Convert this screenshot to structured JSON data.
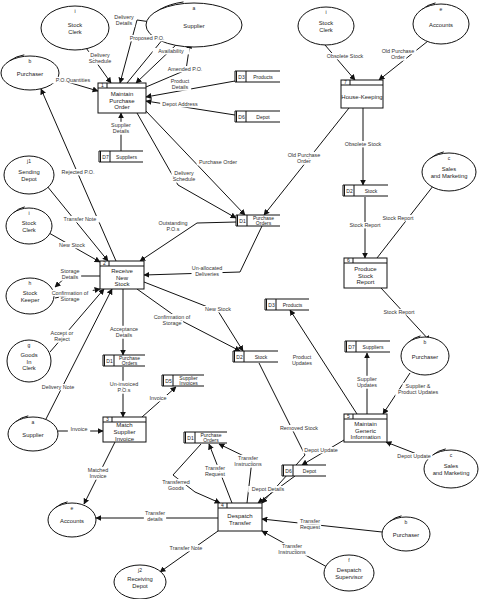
{
  "diagram": {
    "type": "data-flow-diagram",
    "external_entities": [
      {
        "id": "stock-clerk-1",
        "letter": "i",
        "lines": [
          "Stock",
          "Clerk"
        ],
        "cx": 75,
        "cy": 28,
        "rx": 34,
        "ry": 22,
        "dup": false
      },
      {
        "id": "supplier-1",
        "letter": "a",
        "lines": [
          "Supplier"
        ],
        "cx": 194,
        "cy": 25,
        "rx": 48,
        "ry": 22,
        "dup": true
      },
      {
        "id": "purchaser-1",
        "letter": "b",
        "lines": [
          "Purchaser"
        ],
        "cx": 30,
        "cy": 73,
        "rx": 29,
        "ry": 17,
        "dup": true
      },
      {
        "id": "stock-clerk-2",
        "letter": "i",
        "lines": [
          "Stock",
          "Clerk"
        ],
        "cx": 326,
        "cy": 26,
        "rx": 28,
        "ry": 19,
        "dup": false
      },
      {
        "id": "accounts-1",
        "letter": "e",
        "lines": [
          "Accounts"
        ],
        "cx": 441,
        "cy": 24,
        "rx": 28,
        "ry": 20,
        "dup": true
      },
      {
        "id": "sending-depot",
        "letter": "j1",
        "lines": [
          "Sending",
          "Depot"
        ],
        "cx": 29,
        "cy": 175,
        "rx": 25,
        "ry": 19,
        "dup": false
      },
      {
        "id": "sales-marketing-1",
        "letter": "c",
        "lines": [
          "Sales",
          "and Marketing"
        ],
        "cx": 449,
        "cy": 172,
        "rx": 27,
        "ry": 19,
        "dup": true
      },
      {
        "id": "stock-clerk-3",
        "letter": "i",
        "lines": [
          "Stock",
          "Clerk"
        ],
        "cx": 29,
        "cy": 226,
        "rx": 23,
        "ry": 18,
        "dup": true
      },
      {
        "id": "stock-keeper",
        "letter": "h",
        "lines": [
          "Stock",
          "Keeper"
        ],
        "cx": 30,
        "cy": 296,
        "rx": 24,
        "ry": 18,
        "dup": false
      },
      {
        "id": "goods-in-clerk",
        "letter": "g",
        "lines": [
          "Goods",
          "In",
          "Clerk"
        ],
        "cx": 29,
        "cy": 361,
        "rx": 22,
        "ry": 21,
        "dup": false
      },
      {
        "id": "purchaser-2",
        "letter": "b",
        "lines": [
          "Purchaser"
        ],
        "cx": 425,
        "cy": 356,
        "rx": 24,
        "ry": 19,
        "dup": true
      },
      {
        "id": "supplier-2",
        "letter": "a",
        "lines": [
          "Supplier"
        ],
        "cx": 33,
        "cy": 434,
        "rx": 25,
        "ry": 17,
        "dup": true
      },
      {
        "id": "sales-marketing-2",
        "letter": "c",
        "lines": [
          "Sales",
          "and Marketing"
        ],
        "cx": 451,
        "cy": 469,
        "rx": 27,
        "ry": 19,
        "dup": true
      },
      {
        "id": "accounts-2",
        "letter": "e",
        "lines": [
          "Accounts"
        ],
        "cx": 72,
        "cy": 520,
        "rx": 24,
        "ry": 17,
        "dup": true
      },
      {
        "id": "purchaser-3",
        "letter": "b",
        "lines": [
          "Purchaser"
        ],
        "cx": 406,
        "cy": 534,
        "rx": 24,
        "ry": 17,
        "dup": true
      },
      {
        "id": "receiving-depot",
        "letter": "j2",
        "lines": [
          "Receiving",
          "Depot"
        ],
        "cx": 140,
        "cy": 582,
        "rx": 26,
        "ry": 17,
        "dup": false
      },
      {
        "id": "despatch-supervisor",
        "letter": "f",
        "lines": [
          "Despatch",
          "Supervisor"
        ],
        "cx": 349,
        "cy": 573,
        "rx": 25,
        "ry": 18,
        "dup": false
      }
    ],
    "processes": [
      {
        "id": "p1",
        "number": "1",
        "lines": [
          "Maintain",
          "Purchase",
          "Order"
        ],
        "x": 98,
        "y": 83,
        "w": 48,
        "h": 30
      },
      {
        "id": "p7",
        "number": "7",
        "lines": [
          "House-Keeping"
        ],
        "x": 341,
        "y": 80,
        "w": 42,
        "h": 28
      },
      {
        "id": "p2",
        "number": "2",
        "lines": [
          "Receive",
          "New",
          "Stock"
        ],
        "x": 100,
        "y": 261,
        "w": 44,
        "h": 28
      },
      {
        "id": "p6",
        "number": "6",
        "lines": [
          "Produce",
          "Stock",
          "Report"
        ],
        "x": 344,
        "y": 258,
        "w": 43,
        "h": 30
      },
      {
        "id": "p3",
        "number": "3",
        "lines": [
          "Match",
          "Supplier",
          "Invoice"
        ],
        "x": 103,
        "y": 417,
        "w": 43,
        "h": 25
      },
      {
        "id": "p5",
        "number": "5",
        "lines": [
          "Maintain",
          "Generic",
          "Information"
        ],
        "x": 344,
        "y": 414,
        "w": 43,
        "h": 28
      },
      {
        "id": "p4",
        "number": "4",
        "lines": [
          "Despatch",
          "Transfer"
        ],
        "x": 218,
        "y": 503,
        "w": 44,
        "h": 28
      }
    ],
    "data_stores": [
      {
        "id": "d3a",
        "code": "D3",
        "name": "Products",
        "x": 235,
        "y": 71,
        "w": 45
      },
      {
        "id": "d6a",
        "code": "D6",
        "name": "Depot",
        "x": 235,
        "y": 111,
        "w": 45
      },
      {
        "id": "d7a",
        "code": "D7",
        "name": "Suppliers",
        "x": 99,
        "y": 151,
        "w": 44
      },
      {
        "id": "d1a",
        "code": "D1",
        "name": "Purchase Orders",
        "x": 236,
        "y": 215,
        "w": 44
      },
      {
        "id": "d2a",
        "code": "D2",
        "name": "Stock",
        "x": 343,
        "y": 185,
        "w": 45
      },
      {
        "id": "d3b",
        "code": "D3",
        "name": "Products",
        "x": 265,
        "y": 299,
        "w": 44
      },
      {
        "id": "d2b",
        "code": "D2",
        "name": "Stock",
        "x": 233,
        "y": 351,
        "w": 45
      },
      {
        "id": "d7b",
        "code": "D7",
        "name": "Suppliers",
        "x": 345,
        "y": 341,
        "w": 45
      },
      {
        "id": "d1b",
        "code": "D1",
        "name": "Purchase Orders",
        "x": 103,
        "y": 355,
        "w": 42
      },
      {
        "id": "d5",
        "code": "D5",
        "name": "Supplier Invoices",
        "x": 162,
        "y": 375,
        "w": 42
      },
      {
        "id": "d1c",
        "code": "D1",
        "name": "Purchase Orders",
        "x": 184,
        "y": 432,
        "w": 43
      },
      {
        "id": "d6b",
        "code": "D6",
        "name": "Depot",
        "x": 282,
        "y": 465,
        "w": 44
      }
    ],
    "flows": [
      {
        "label": "Delivery Schedule",
        "lx": 100,
        "ly": 60,
        "pts": [
          [
            84,
            45
          ],
          [
            111,
            83
          ]
        ]
      },
      {
        "label": "Delivery Details",
        "lx": 124,
        "ly": 22,
        "pts": [
          [
            165,
            24
          ],
          [
            137,
            20
          ],
          [
            120,
            83
          ]
        ]
      },
      {
        "label": "Proposed P.O.",
        "lx": 147,
        "ly": 40,
        "pts": [
          [
            127,
            83
          ],
          [
            172,
            28
          ]
        ]
      },
      {
        "label": "Availability",
        "lx": 171,
        "ly": 53,
        "pts": [
          [
            178,
            43
          ],
          [
            136,
            83
          ]
        ]
      },
      {
        "label": "Amended P.O.",
        "lx": 185,
        "ly": 71,
        "pts": [
          [
            146,
            87
          ],
          [
            186,
            70
          ],
          [
            190,
            43
          ]
        ]
      },
      {
        "label": "P.O.Quantities",
        "lx": 73,
        "ly": 82,
        "pts": [
          [
            54,
            78
          ],
          [
            98,
            91
          ]
        ]
      },
      {
        "label": "Product Details",
        "lx": 180,
        "ly": 86,
        "pts": [
          [
            235,
            81
          ],
          [
            146,
            97
          ]
        ]
      },
      {
        "label": "Depot Address",
        "lx": 180,
        "ly": 106,
        "pts": [
          [
            235,
            115
          ],
          [
            146,
            101
          ]
        ]
      },
      {
        "label": "Supplier Details",
        "lx": 121,
        "ly": 130,
        "pts": [
          [
            121,
            151
          ],
          [
            121,
            113
          ]
        ]
      },
      {
        "label": "Purchase Order",
        "lx": 218,
        "ly": 164,
        "pts": [
          [
            146,
            111
          ],
          [
            245,
            215
          ]
        ]
      },
      {
        "label": "Delivery Schedule",
        "lx": 184,
        "ly": 178,
        "pts": [
          [
            137,
            113
          ],
          [
            178,
            185
          ],
          [
            236,
            218
          ]
        ]
      },
      {
        "label": "Obsolete Stock",
        "lx": 345,
        "ly": 58,
        "pts": [
          [
            325,
            45
          ],
          [
            355,
            80
          ]
        ]
      },
      {
        "label": "Old Purchase Order",
        "lx": 398,
        "ly": 56,
        "pts": [
          [
            428,
            41
          ],
          [
            379,
            80
          ]
        ]
      },
      {
        "label": "Obsolete Stock",
        "lx": 363,
        "ly": 146,
        "pts": [
          [
            363,
            108
          ],
          [
            363,
            185
          ]
        ]
      },
      {
        "label": "Old Purchase Order",
        "lx": 304,
        "ly": 160,
        "pts": [
          [
            349,
            108
          ],
          [
            264,
            215
          ]
        ]
      },
      {
        "label": "Stock Report",
        "lx": 365,
        "ly": 227,
        "pts": [
          [
            365,
            197
          ],
          [
            365,
            258
          ]
        ]
      },
      {
        "label": "Stock Report",
        "lx": 398,
        "ly": 220,
        "pts": [
          [
            377,
            258
          ],
          [
            437,
            181
          ]
        ]
      },
      {
        "label": "Stock Report",
        "lx": 399,
        "ly": 314,
        "pts": [
          [
            381,
            288
          ],
          [
            430,
            341
          ]
        ]
      },
      {
        "label": "Rejected P.O.",
        "lx": 78,
        "ly": 174,
        "pts": [
          [
            116,
            261
          ],
          [
            41,
            89
          ]
        ]
      },
      {
        "label": "Transfer Note",
        "lx": 80,
        "ly": 221,
        "pts": [
          [
            47,
            186
          ],
          [
            108,
            261
          ]
        ]
      },
      {
        "label": "New Stock",
        "lx": 72,
        "ly": 247,
        "pts": [
          [
            49,
            233
          ],
          [
            100,
            262
          ]
        ]
      },
      {
        "label": "Outstanding P.O.s",
        "lx": 173,
        "ly": 228,
        "pts": [
          [
            236,
            222
          ],
          [
            197,
            223
          ],
          [
            140,
            261
          ]
        ]
      },
      {
        "label": "Un-allocated Deliveries",
        "lx": 207,
        "ly": 273,
        "pts": [
          [
            262,
            226
          ],
          [
            240,
            272
          ],
          [
            144,
            275
          ]
        ]
      },
      {
        "label": "Storage Details",
        "lx": 70,
        "ly": 276,
        "pts": [
          [
            100,
            276
          ],
          [
            67,
            276
          ],
          [
            55,
            287
          ]
        ]
      },
      {
        "label": "Confirmation of Storage",
        "lx": 70,
        "ly": 298,
        "pts": [
          [
            55,
            298
          ],
          [
            100,
            289
          ]
        ]
      },
      {
        "label": "Accept or Reject",
        "lx": 62,
        "ly": 338,
        "pts": [
          [
            50,
            352
          ],
          [
            104,
            289
          ]
        ]
      },
      {
        "label": "Delivery Note",
        "lx": 58,
        "ly": 389,
        "pts": [
          [
            46,
            419
          ],
          [
            112,
            289
          ]
        ]
      },
      {
        "label": "Acceptance Details",
        "lx": 124,
        "ly": 334,
        "pts": [
          [
            123,
            289
          ],
          [
            123,
            355
          ]
        ]
      },
      {
        "label": "Confirmation of Storage",
        "lx": 172,
        "ly": 322,
        "pts": [
          [
            137,
            289
          ],
          [
            182,
            321
          ],
          [
            240,
            351
          ]
        ]
      },
      {
        "label": "New Stock",
        "lx": 218,
        "ly": 311,
        "pts": [
          [
            144,
            282
          ],
          [
            218,
            311
          ],
          [
            243,
            351
          ]
        ]
      },
      {
        "label": "Un-invoiced P.O.s",
        "lx": 124,
        "ly": 389,
        "pts": [
          [
            123,
            367
          ],
          [
            123,
            417
          ]
        ]
      },
      {
        "label": "Invoice",
        "lx": 158,
        "ly": 400,
        "pts": [
          [
            142,
            417
          ],
          [
            176,
            387
          ]
        ]
      },
      {
        "label": "Invoice",
        "lx": 79,
        "ly": 431,
        "pts": [
          [
            58,
            431
          ],
          [
            103,
            431
          ]
        ]
      },
      {
        "label": "Matched Invoice",
        "lx": 98,
        "ly": 475,
        "pts": [
          [
            115,
            442
          ],
          [
            84,
            504
          ]
        ]
      },
      {
        "label": "Product Updates",
        "lx": 302,
        "ly": 362,
        "pts": [
          [
            357,
            414
          ],
          [
            290,
            310
          ]
        ]
      },
      {
        "label": "Supplier Updates",
        "lx": 367,
        "ly": 384,
        "pts": [
          [
            367,
            414
          ],
          [
            367,
            353
          ]
        ]
      },
      {
        "label": "Supplier & Product Updates",
        "lx": 418,
        "ly": 391,
        "pts": [
          [
            410,
            373
          ],
          [
            383,
            414
          ]
        ]
      },
      {
        "label": "Removed Stock",
        "lx": 299,
        "ly": 430,
        "pts": [
          [
            259,
            363
          ],
          [
            305,
            455
          ],
          [
            262,
            503
          ]
        ]
      },
      {
        "label": "Depot Update",
        "lx": 321,
        "ly": 452,
        "pts": [
          [
            344,
            440
          ],
          [
            302,
            465
          ]
        ]
      },
      {
        "label": "Depot Update",
        "lx": 414,
        "ly": 458,
        "pts": [
          [
            427,
            458
          ],
          [
            386,
            442
          ]
        ]
      },
      {
        "label": "Transfer Request",
        "lx": 215,
        "ly": 473,
        "pts": [
          [
            232,
            503
          ],
          [
            209,
            444
          ]
        ]
      },
      {
        "label": "Transfer Instructions",
        "lx": 248,
        "ly": 463,
        "pts": [
          [
            247,
            503
          ],
          [
            252,
            460
          ],
          [
            219,
            444
          ]
        ]
      },
      {
        "label": "Depot Details",
        "lx": 268,
        "ly": 491,
        "pts": [
          [
            295,
            476
          ],
          [
            258,
            503
          ]
        ]
      },
      {
        "label": "Transferred Goods",
        "lx": 176,
        "ly": 487,
        "pts": [
          [
            201,
            444
          ],
          [
            173,
            475
          ],
          [
            195,
            492
          ],
          [
            220,
            503
          ]
        ]
      },
      {
        "label": "Transfer details",
        "lx": 155,
        "ly": 518,
        "pts": [
          [
            218,
            518
          ],
          [
            96,
            518
          ]
        ]
      },
      {
        "label": "Transfer Note",
        "lx": 186,
        "ly": 550,
        "pts": [
          [
            218,
            531
          ],
          [
            160,
            572
          ]
        ]
      },
      {
        "label": "Transfer Request",
        "lx": 310,
        "ly": 526,
        "pts": [
          [
            382,
            532
          ],
          [
            262,
            519
          ]
        ]
      },
      {
        "label": "Transfer Instructions",
        "lx": 292,
        "ly": 551,
        "pts": [
          [
            327,
            567
          ],
          [
            262,
            531
          ]
        ]
      }
    ]
  },
  "colors": {
    "background": "#ffffff",
    "ink": "#111111",
    "text": "#222222"
  }
}
